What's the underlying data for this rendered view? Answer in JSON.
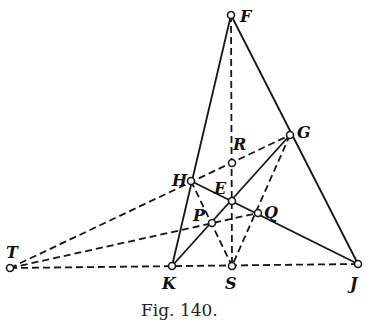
{
  "figure": {
    "caption": "Fig. 140.",
    "points": {
      "F": {
        "x": 231,
        "y": 15,
        "label": "F"
      },
      "G": {
        "x": 290,
        "y": 135,
        "label": "G"
      },
      "R": {
        "x": 232,
        "y": 163,
        "label": "R"
      },
      "H": {
        "x": 191,
        "y": 181,
        "label": "H"
      },
      "E": {
        "x": 232,
        "y": 201,
        "label": "E"
      },
      "P": {
        "x": 212,
        "y": 223,
        "label": "P"
      },
      "Q": {
        "x": 258,
        "y": 213,
        "label": "Q"
      },
      "T": {
        "x": 10,
        "y": 268,
        "label": "T"
      },
      "K": {
        "x": 172,
        "y": 266,
        "label": "K"
      },
      "S": {
        "x": 232,
        "y": 266,
        "label": "S"
      },
      "J": {
        "x": 358,
        "y": 264,
        "label": "J"
      }
    },
    "solid_lines": [
      [
        "F",
        "K"
      ],
      [
        "F",
        "J"
      ],
      [
        "H",
        "J"
      ],
      [
        "G",
        "K"
      ]
    ],
    "dashed_lines": [
      [
        "F",
        "S"
      ],
      [
        "T",
        "G"
      ],
      [
        "T",
        "Q"
      ],
      [
        "T",
        "J"
      ],
      [
        "H",
        "S"
      ],
      [
        "G",
        "S"
      ]
    ]
  }
}
